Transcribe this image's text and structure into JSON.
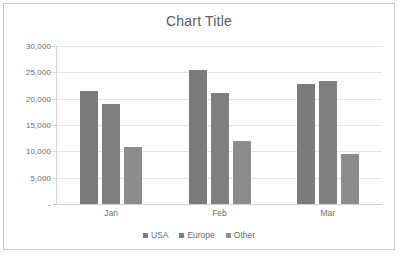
{
  "chart_data": {
    "type": "bar",
    "title": "Chart Title",
    "xlabel": "",
    "ylabel": "",
    "categories": [
      "Jan",
      "Feb",
      "Mar"
    ],
    "series": [
      {
        "name": "USA",
        "values": [
          21400,
          25400,
          22700
        ],
        "color": "#7b7b7b"
      },
      {
        "name": "Europe",
        "values": [
          19000,
          21100,
          23400
        ],
        "color": "#7f7f7f"
      },
      {
        "name": "Other",
        "values": [
          10900,
          12050,
          9550
        ],
        "color": "#8c8c8c"
      }
    ],
    "ylim": [
      0,
      30000
    ],
    "y_ticks": [
      0,
      5000,
      10000,
      15000,
      20000,
      25000,
      30000
    ],
    "y_tick_labels": [
      "-",
      "5,000",
      "10,000",
      "15,000",
      "20,000",
      "25,000",
      "30,000"
    ],
    "grid": true,
    "legend_position": "bottom",
    "gridline_color": "#e3e3e3",
    "border_color": "#c9c9c9",
    "text_color": "#6b6b6b",
    "plot_background": "#ffffff"
  }
}
